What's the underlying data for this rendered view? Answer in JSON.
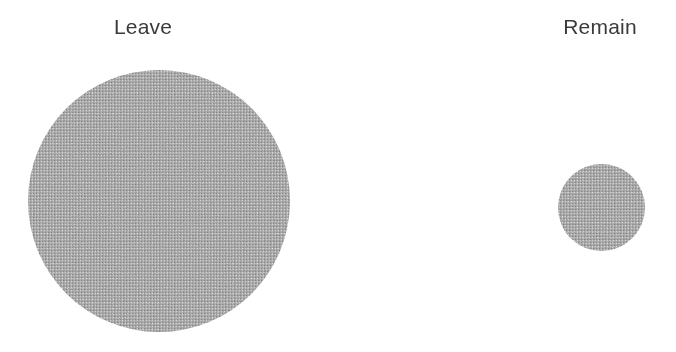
{
  "figure": {
    "background_color": "#ffffff",
    "width": 676,
    "height": 352,
    "label_color": "#3a3a3a",
    "bubble_color": "#a9a9a9"
  },
  "bubbles": [
    {
      "key": "leave",
      "label": "Leave",
      "diameter_px": 262,
      "center_x": 159,
      "center_y": 201,
      "label_x": 143,
      "label_y": 16
    },
    {
      "key": "remain",
      "label": "Remain",
      "diameter_px": 87,
      "center_x": 601,
      "center_y": 207,
      "label_x": 600,
      "label_y": 16
    }
  ],
  "chart_data": {
    "type": "bubble",
    "title": "",
    "subtitle": "",
    "xlabel": "",
    "ylabel": "",
    "grid": false,
    "legend_position": "none",
    "encoding": "area-proportional circles",
    "categories": [
      "Leave",
      "Remain"
    ],
    "diameters_px": [
      262,
      87
    ],
    "relative_area": [
      1.0,
      0.11
    ],
    "values": [
      9.06,
      1.0
    ],
    "annotations": [
      "Leave",
      "Remain"
    ],
    "series": [
      {
        "name": "Vote share (area-proportional)",
        "values": [
          9.06,
          1.0
        ]
      }
    ]
  }
}
